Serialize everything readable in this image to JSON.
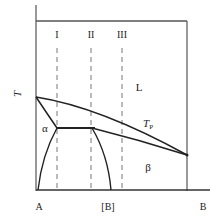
{
  "diagram": {
    "type": "peritectic binary phase diagram",
    "axis": {
      "y_label": "T",
      "x_left_label": "A",
      "x_right_label": "B",
      "x_marker_label": "[B]"
    },
    "phase_labels": {
      "liquid": "L",
      "alpha": "α",
      "beta": "β"
    },
    "peritectic_temperature_label": {
      "main": "T",
      "sub": "P"
    },
    "composition_lines": [
      {
        "label": "I"
      },
      {
        "label": "II"
      },
      {
        "label": "III"
      }
    ],
    "colors": {
      "line": "#222222",
      "axis": "#555555",
      "background": "#ffffff"
    }
  }
}
